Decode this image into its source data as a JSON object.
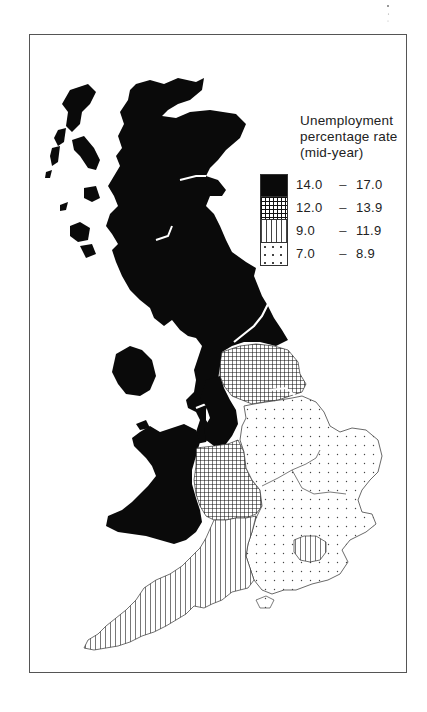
{
  "title": {
    "line1": "Unemployment",
    "line2": "percentage rate",
    "line3": "(mid-year)"
  },
  "legend": {
    "items": [
      {
        "low": "14.0",
        "dash": "–",
        "high": "17.0",
        "pattern": "solid-black"
      },
      {
        "low": "12.0",
        "dash": "–",
        "high": "13.9",
        "pattern": "cross-hatch-grid"
      },
      {
        "low": "9.0",
        "dash": "–",
        "high": "11.9",
        "pattern": "vertical-lines"
      },
      {
        "low": "7.0",
        "dash": "–",
        "high": "8.9",
        "pattern": "sparse-dots"
      }
    ]
  },
  "map": {
    "subject": "United Kingdom regional unemployment",
    "regions": [
      {
        "name": "Scotland",
        "class": "14.0 – 17.0"
      },
      {
        "name": "Northern Ireland",
        "class": "14.0 – 17.0"
      },
      {
        "name": "North",
        "class": "14.0 – 17.0"
      },
      {
        "name": "North West",
        "class": "14.0 – 17.0"
      },
      {
        "name": "Wales",
        "class": "14.0 – 17.0"
      },
      {
        "name": "Yorkshire and Humberside",
        "class": "12.0 – 13.9"
      },
      {
        "name": "West Midlands",
        "class": "12.0 – 13.9"
      },
      {
        "name": "South West",
        "class": "9.0 – 11.9"
      },
      {
        "name": "Greater London",
        "class": "9.0 – 11.9"
      },
      {
        "name": "East Midlands",
        "class": "7.0 – 8.9"
      },
      {
        "name": "East Anglia",
        "class": "7.0 – 8.9"
      },
      {
        "name": "South East",
        "class": "7.0 – 8.9"
      }
    ]
  },
  "colors": {
    "ink": "#0a0a0a",
    "paper": "#ffffff",
    "frame": "#555555"
  }
}
